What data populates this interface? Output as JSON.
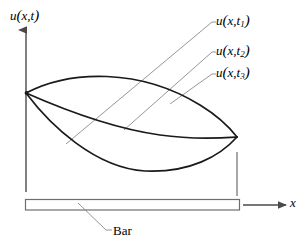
{
  "figure": {
    "background_color": "#ffffff",
    "stroke_color": "#1a1a1a",
    "leader_color": "#6e6e6e"
  },
  "axes": {
    "y_axis": {
      "name": "vertical-axis",
      "label": "u(x,t)",
      "label_parts": {
        "func": "u",
        "open": "(",
        "var1": "x",
        "comma": ",",
        "var2": "t",
        "close": ")"
      },
      "x": 26,
      "y_top": 28,
      "y_bottom": 192,
      "arrow": "up"
    },
    "x_axis": {
      "name": "horizontal-axis",
      "label": "x",
      "x_start": 243,
      "x_end": 288,
      "y": 205,
      "arrow": "right"
    }
  },
  "curves": [
    {
      "id": "t1",
      "name": "curve-u-x-t1",
      "label": "u(x,t1)",
      "label_func": "u",
      "label_var": "x",
      "label_time": "t",
      "label_index": "1",
      "description": "upward arched displacement profile at time t1",
      "start": [
        26,
        93
      ],
      "end": [
        237,
        137
      ],
      "peak": [
        100,
        78
      ],
      "path": "M26,93 C70,70 140,68 200,105 C218,116 230,128 237,137"
    },
    {
      "id": "t2",
      "name": "curve-u-x-t2",
      "label": "u(x,t2)",
      "label_func": "u",
      "label_var": "x",
      "label_time": "t",
      "label_index": "2",
      "description": "shallow sagging displacement profile at time t2",
      "start": [
        26,
        93
      ],
      "end": [
        237,
        137
      ],
      "lowest": [
        150,
        134
      ],
      "path": "M26,93 C60,108 110,128 160,135 C195,140 222,138 237,137"
    },
    {
      "id": "t3",
      "name": "curve-u-x-t3",
      "label": "u(x,t3)",
      "label_func": "u",
      "label_var": "x",
      "label_time": "t",
      "label_index": "3",
      "description": "deep sagging displacement profile at time t3",
      "start": [
        26,
        93
      ],
      "end": [
        237,
        137
      ],
      "lowest": [
        140,
        170
      ],
      "path": "M26,93 C50,125 95,168 145,171 C190,173 220,156 237,137"
    }
  ],
  "leaders": [
    {
      "name": "leader-line-t1",
      "from_curve": "t3",
      "path": "M66,144 L212,22 L214,22"
    },
    {
      "name": "leader-line-t2",
      "from_curve": "t2",
      "path": "M124,130 L212,52 L214,52"
    },
    {
      "name": "leader-line-t3",
      "from_curve": "t1",
      "path": "M170,104 L212,74 L214,74"
    },
    {
      "name": "leader-line-bar",
      "path": "M78,203 L106,230 L112,230"
    }
  ],
  "drop_line": {
    "name": "drop-line-right-end",
    "x": 237,
    "y_top": 152,
    "y_bottom": 196
  },
  "bar": {
    "name": "bar-rectangle",
    "label": "Bar",
    "x": 25,
    "y": 199,
    "width": 215,
    "height": 11,
    "fill": "#ffffff",
    "stroke": "#6e6e6e"
  }
}
